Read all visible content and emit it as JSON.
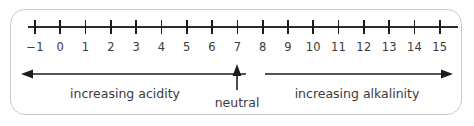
{
  "figure": {
    "name": "ph-scale-number-line",
    "background_color": "#ffffff",
    "frame_border_color": "#c9c9c9",
    "line_color": "#2b2b2b",
    "text_color": "#3a3a3a"
  },
  "chart_data": {
    "type": "line",
    "title": "",
    "xlabel": "",
    "ylabel": "",
    "grid": false,
    "legend": "none",
    "xlim": [
      -1,
      15
    ],
    "categories": [
      "-1",
      "0",
      "1",
      "2",
      "3",
      "4",
      "5",
      "6",
      "7",
      "8",
      "9",
      "10",
      "11",
      "12",
      "13",
      "14",
      "15"
    ],
    "tick_labels": [
      "−1",
      "0",
      "1",
      "2",
      "3",
      "4",
      "5",
      "6",
      "7",
      "8",
      "9",
      "10",
      "11",
      "12",
      "13",
      "14",
      "15"
    ],
    "values": [
      -1,
      0,
      1,
      2,
      3,
      4,
      5,
      6,
      7,
      8,
      9,
      10,
      11,
      12,
      13,
      14,
      15
    ],
    "annotations": [
      {
        "name": "increasing-acidity",
        "text": "increasing acidity",
        "direction": "left",
        "range": [
          -1,
          7
        ]
      },
      {
        "name": "neutral",
        "text": "neutral",
        "direction": "up",
        "at": 7
      },
      {
        "name": "increasing-alkalinity",
        "text": "increasing alkalinity",
        "direction": "right",
        "range": [
          7,
          15
        ]
      }
    ]
  },
  "labels": {
    "acidity": "increasing acidity",
    "neutral": "neutral",
    "alkalinity": "increasing alkalinity"
  }
}
